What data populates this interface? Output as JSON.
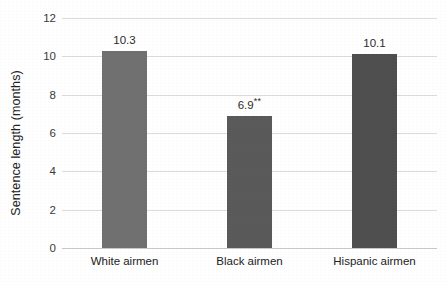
{
  "chart_data": {
    "type": "bar",
    "title": "",
    "xlabel": "",
    "ylabel": "Sentence length (months)",
    "categories": [
      "White airmen",
      "Black airmen",
      "Hispanic airmen"
    ],
    "values": [
      10.3,
      6.9,
      10.1
    ],
    "point_labels": [
      "10.3",
      "6.9",
      "10.1"
    ],
    "significance_markers": [
      "",
      "**",
      ""
    ],
    "ylim": [
      0,
      12
    ],
    "yticks": [
      "12",
      "10",
      "8",
      "6",
      "4",
      "2",
      "0"
    ],
    "ytick_values": [
      12,
      10,
      8,
      6,
      4,
      2,
      0
    ],
    "grid": "horizontal",
    "legend": "none",
    "bar_colors": [
      "#707070",
      "#5a5a5a",
      "#4f4f4f"
    ],
    "gridline_color": "#dcdcdc",
    "background_color": "#ffffff"
  }
}
